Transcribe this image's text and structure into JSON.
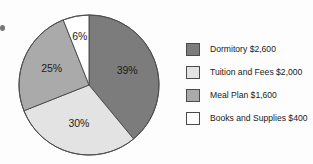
{
  "chart_data": {
    "type": "pie",
    "title": "",
    "categories": [
      "Dormitory",
      "Tuition and Fees",
      "Meal Plan",
      "Books and Supplies"
    ],
    "values": [
      2600,
      2000,
      1600,
      400
    ],
    "percent_labels": [
      "39%",
      "30%",
      "25%",
      "6%"
    ],
    "percents": [
      39,
      30,
      25,
      6
    ],
    "amount_labels": [
      "$2,600",
      "$2,000",
      "$1,600",
      "$400"
    ],
    "colors": [
      "#7b7c7b",
      "#e2e3e2",
      "#a9aaa9",
      "#ffffff"
    ],
    "start_angle_deg": 0,
    "direction": "clockwise",
    "legend_position": "right",
    "grid": false,
    "slices": [
      {
        "label": "Dormitory",
        "amount": "$2,600",
        "percent_label": "39%",
        "percent": 39,
        "color": "#7b7c7b",
        "legend_text": "Dormitory $2,600"
      },
      {
        "label": "Tuition and Fees",
        "amount": "$2,000",
        "percent_label": "30%",
        "percent": 30,
        "color": "#e2e3e2",
        "legend_text": "Tuition and Fees $2,000"
      },
      {
        "label": "Meal Plan",
        "amount": "$1,600",
        "percent_label": "25%",
        "percent": 25,
        "color": "#a9aaa9",
        "legend_text": "Meal Plan $1,600"
      },
      {
        "label": "Books and Supplies",
        "amount": "$400",
        "percent_label": "6%",
        "percent": 6,
        "color": "#ffffff",
        "legend_text": "Books and Supplies $400"
      }
    ]
  },
  "pie": {
    "center_x": 71,
    "center_y": 71,
    "radius": 70,
    "outline_color": "#4f4f4f"
  },
  "legend": {
    "rows": [
      {
        "text": "Dormitory $2,600",
        "color": "#7b7c7b"
      },
      {
        "text": "Tuition and Fees $2,000",
        "color": "#e2e3e2"
      },
      {
        "text": "Meal Plan $1,600",
        "color": "#a9aaa9"
      },
      {
        "text": "Books and Supplies $400",
        "color": "#ffffff"
      }
    ]
  }
}
